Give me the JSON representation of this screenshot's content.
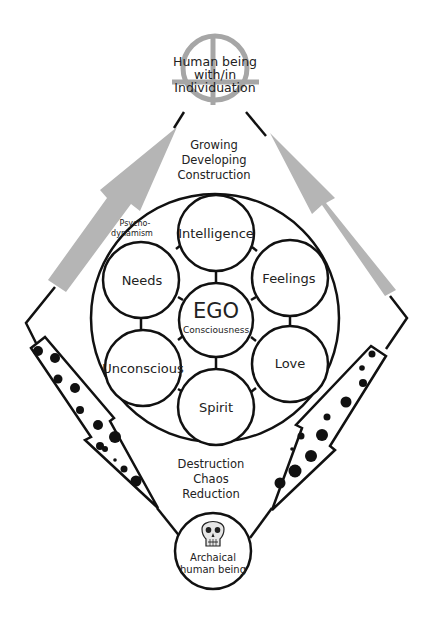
{
  "diagram": {
    "top_node": {
      "lines": [
        "Human being",
        "with/in",
        "Individuation"
      ],
      "color": "#a6a6a6"
    },
    "growth_label": [
      "Growing",
      "Developing",
      "Construction"
    ],
    "decline_label": [
      "Destruction",
      "Chaos",
      "Reduction"
    ],
    "outer_circle_label": [
      "Psycho-",
      "dynamism"
    ],
    "center_node": {
      "title": "EGO",
      "subtitle": "Consciousness"
    },
    "satellites": [
      {
        "id": "intelligence",
        "label": "Intelligence"
      },
      {
        "id": "needs",
        "label": "Needs"
      },
      {
        "id": "feelings",
        "label": "Feelings"
      },
      {
        "id": "unconscious",
        "label": "Unconscious"
      },
      {
        "id": "love",
        "label": "Love"
      },
      {
        "id": "spirit",
        "label": "Spirit"
      }
    ],
    "bottom_node": {
      "icon": "skull-icon",
      "lines": [
        "Archaical",
        "human being"
      ]
    },
    "colors": {
      "stroke": "#111111",
      "up_arrow": "#b5b5b5",
      "crosshair": "#a6a6a6"
    }
  }
}
